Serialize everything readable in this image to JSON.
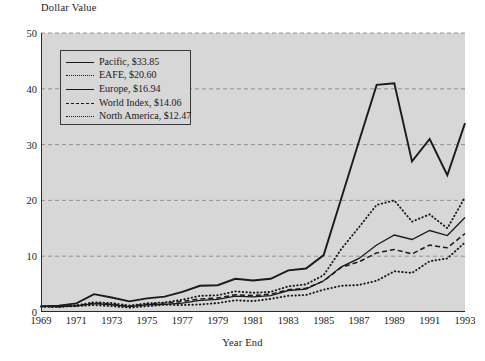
{
  "chart_data": {
    "type": "line",
    "title": "",
    "ylabel": "Dollar Value",
    "xlabel": "Year End",
    "ylim": [
      0,
      50
    ],
    "yticks": [
      0,
      10,
      20,
      30,
      40,
      50
    ],
    "xlim": [
      1969,
      1993
    ],
    "xticks": [
      1969,
      1971,
      1973,
      1975,
      1977,
      1979,
      1981,
      1983,
      1985,
      1987,
      1989,
      1991,
      1993
    ],
    "grid": "horizontal-dashed",
    "legend_position": "upper-left-inside",
    "plot_background": "#d7d7d7",
    "line_color": "#1a1a1a",
    "x": [
      1969,
      1970,
      1971,
      1972,
      1973,
      1974,
      1975,
      1976,
      1977,
      1978,
      1979,
      1980,
      1981,
      1982,
      1983,
      1984,
      1985,
      1986,
      1987,
      1988,
      1989,
      1990,
      1991,
      1992,
      1993
    ],
    "series": [
      {
        "name": "Pacific",
        "end_value_label": "$33.85",
        "style": "solid-thick",
        "values": [
          1.0,
          1.15,
          1.55,
          3.2,
          2.6,
          1.9,
          2.45,
          2.75,
          3.6,
          4.7,
          4.8,
          5.95,
          5.65,
          5.95,
          7.45,
          7.8,
          10.2,
          20.4,
          30.6,
          40.7,
          41.0,
          27.0,
          31.0,
          24.5,
          33.85
        ]
      },
      {
        "name": "EAFE",
        "end_value_label": "$20.60",
        "style": "dotted",
        "values": [
          1.0,
          0.92,
          1.18,
          1.75,
          1.6,
          1.15,
          1.55,
          1.7,
          2.2,
          2.9,
          3.0,
          3.7,
          3.45,
          3.6,
          4.6,
          4.95,
          6.6,
          11.3,
          15.2,
          19.2,
          20.0,
          16.2,
          17.5,
          15.0,
          20.6
        ]
      },
      {
        "name": "Europe",
        "end_value_label": "$16.94",
        "style": "solid-thin",
        "values": [
          1.0,
          0.95,
          1.1,
          1.5,
          1.3,
          0.95,
          1.3,
          1.35,
          1.6,
          2.1,
          2.25,
          2.85,
          2.7,
          2.95,
          3.85,
          4.1,
          5.6,
          8.1,
          9.6,
          12.0,
          13.8,
          13.0,
          14.6,
          13.7,
          16.94
        ]
      },
      {
        "name": "World Index",
        "end_value_label": "$14.06",
        "style": "dashed",
        "values": [
          1.0,
          0.95,
          1.15,
          1.6,
          1.4,
          1.05,
          1.4,
          1.6,
          1.9,
          2.35,
          2.5,
          3.1,
          2.95,
          3.2,
          4.0,
          4.25,
          5.55,
          8.0,
          9.0,
          10.6,
          11.2,
          10.4,
          12.0,
          11.5,
          14.06
        ]
      },
      {
        "name": "North America",
        "end_value_label": "$12.47",
        "style": "dotted",
        "values": [
          1.0,
          0.98,
          1.05,
          1.25,
          1.05,
          0.78,
          1.05,
          1.3,
          1.25,
          1.35,
          1.6,
          2.1,
          1.95,
          2.35,
          2.9,
          3.05,
          4.0,
          4.7,
          4.85,
          5.6,
          7.3,
          7.0,
          9.1,
          9.6,
          12.47
        ]
      }
    ],
    "legend": [
      {
        "label": "Pacific, $33.85",
        "style": "solid-thick"
      },
      {
        "label": "EAFE, $20.60",
        "style": "dotted"
      },
      {
        "label": "Europe, $16.94",
        "style": "solid-thin"
      },
      {
        "label": "World Index, $14.06",
        "style": "dashed"
      },
      {
        "label": "North America, $12.47",
        "style": "dotted"
      }
    ]
  }
}
